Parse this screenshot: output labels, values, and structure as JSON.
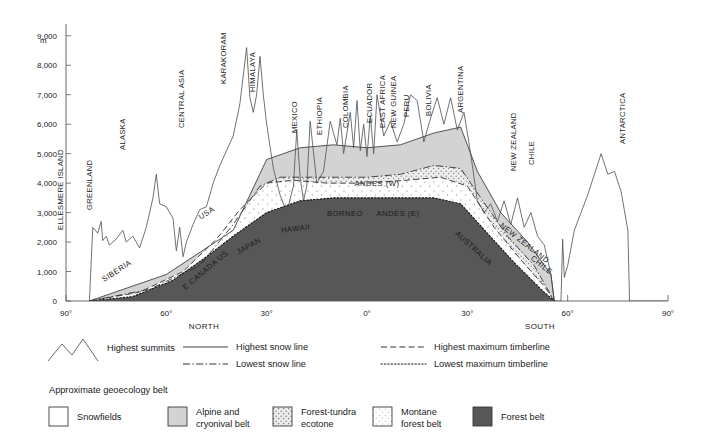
{
  "figure": {
    "unit_label": "m",
    "caption": ""
  },
  "chart_data": {
    "type": "area",
    "title": "",
    "xlabel": "",
    "ylabel": "m",
    "xlim": [
      -90,
      90
    ],
    "ylim": [
      0,
      9400
    ],
    "grid": false,
    "legend_position": "below-axis",
    "y_ticks": [
      "0",
      "1,000",
      "2,000",
      "3,000",
      "4,000",
      "5,000",
      "6,000",
      "7,000",
      "8,000",
      "9,000"
    ],
    "y_tick_values": [
      0,
      1000,
      2000,
      3000,
      4000,
      5000,
      6000,
      7000,
      8000,
      9000
    ],
    "x_ticks_north": [
      "90°",
      "60°",
      "30°",
      "0°"
    ],
    "x_ticks_south": [
      "30°",
      "60°",
      "90°"
    ],
    "x_tick_values": [
      -90,
      -60,
      -30,
      0,
      30,
      60,
      90
    ],
    "hemisphere_labels": {
      "left": "NORTH",
      "right": "SOUTH"
    },
    "series": [
      {
        "name": "Highest summits",
        "style": "solid-thin",
        "points": [
          [
            -83,
            0
          ],
          [
            -82,
            2500
          ],
          [
            -80.5,
            2300
          ],
          [
            -79.5,
            2700
          ],
          [
            -79,
            2050
          ],
          [
            -78,
            2200
          ],
          [
            -77,
            1900
          ],
          [
            -75,
            2100
          ],
          [
            -73,
            2400
          ],
          [
            -72,
            2000
          ],
          [
            -70,
            2200
          ],
          [
            -68,
            1800
          ],
          [
            -66,
            2500
          ],
          [
            -64,
            3500
          ],
          [
            -63,
            4300
          ],
          [
            -62,
            3300
          ],
          [
            -60,
            3200
          ],
          [
            -58,
            2800
          ],
          [
            -57,
            1700
          ],
          [
            -56,
            2500
          ],
          [
            -55,
            1500
          ],
          [
            -54,
            2000
          ],
          [
            -52,
            2600
          ],
          [
            -50,
            3100
          ],
          [
            -48,
            3200
          ],
          [
            -46,
            4000
          ],
          [
            -44,
            4600
          ],
          [
            -42,
            5100
          ],
          [
            -40,
            5600
          ],
          [
            -38,
            6700
          ],
          [
            -36,
            8600
          ],
          [
            -35,
            6900
          ],
          [
            -34,
            6400
          ],
          [
            -33,
            7000
          ],
          [
            -32,
            8300
          ],
          [
            -31,
            7000
          ],
          [
            -30,
            6000
          ],
          [
            -28,
            4500
          ],
          [
            -26,
            3600
          ],
          [
            -24,
            3000
          ],
          [
            -22,
            3900
          ],
          [
            -21,
            5800
          ],
          [
            -20,
            4200
          ],
          [
            -19,
            3400
          ],
          [
            -18,
            3900
          ],
          [
            -17,
            6100
          ],
          [
            -15,
            4000
          ],
          [
            -13,
            4400
          ],
          [
            -11,
            6100
          ],
          [
            -9,
            5300
          ],
          [
            -8,
            6200
          ],
          [
            -7,
            5000
          ],
          [
            -5,
            6400
          ],
          [
            -4,
            5200
          ],
          [
            -3,
            6800
          ],
          [
            -2,
            5100
          ],
          [
            -1,
            6000
          ],
          [
            0,
            4900
          ],
          [
            1,
            6300
          ],
          [
            2,
            5000
          ],
          [
            3,
            7000
          ],
          [
            5,
            5600
          ],
          [
            7,
            6100
          ],
          [
            9,
            5400
          ],
          [
            11,
            6000
          ],
          [
            13,
            7000
          ],
          [
            15,
            6800
          ],
          [
            17,
            5400
          ],
          [
            19,
            6200
          ],
          [
            21,
            6900
          ],
          [
            23,
            6000
          ],
          [
            25,
            6900
          ],
          [
            27,
            5800
          ],
          [
            29,
            6400
          ],
          [
            31,
            5000
          ],
          [
            33,
            3400
          ],
          [
            35,
            3000
          ],
          [
            37,
            3300
          ],
          [
            39,
            2700
          ],
          [
            41,
            3400
          ],
          [
            43,
            2600
          ],
          [
            45,
            3500
          ],
          [
            47,
            2500
          ],
          [
            49,
            3000
          ],
          [
            51,
            2200
          ],
          [
            53,
            1900
          ],
          [
            55,
            900
          ],
          [
            56,
            0
          ],
          [
            58,
            0
          ],
          [
            58.5,
            2100
          ],
          [
            59,
            800
          ],
          [
            60,
            1200
          ],
          [
            62,
            2400
          ],
          [
            66,
            3600
          ],
          [
            70,
            5000
          ],
          [
            72,
            4300
          ],
          [
            74,
            4400
          ],
          [
            76,
            3700
          ],
          [
            78,
            2400
          ],
          [
            78.5,
            0
          ],
          [
            90,
            0
          ]
        ]
      },
      {
        "name": "Highest snow line",
        "style": "solid",
        "points": [
          [
            -83,
            0
          ],
          [
            -60,
            900
          ],
          [
            -40,
            2400
          ],
          [
            -30,
            4800
          ],
          [
            -20,
            5200
          ],
          [
            -10,
            5300
          ],
          [
            0,
            5200
          ],
          [
            10,
            5300
          ],
          [
            20,
            5700
          ],
          [
            28,
            5900
          ],
          [
            33,
            4400
          ],
          [
            40,
            3000
          ],
          [
            48,
            2000
          ],
          [
            55,
            900
          ],
          [
            56,
            0
          ]
        ]
      },
      {
        "name": "Lowest snow line",
        "style": "dash-dot",
        "points": [
          [
            -83,
            0
          ],
          [
            -65,
            400
          ],
          [
            -50,
            1200
          ],
          [
            -40,
            2600
          ],
          [
            -32,
            3900
          ],
          [
            -26,
            4200
          ],
          [
            -18,
            4200
          ],
          [
            -10,
            4200
          ],
          [
            0,
            4200
          ],
          [
            10,
            4300
          ],
          [
            20,
            4600
          ],
          [
            28,
            4500
          ],
          [
            34,
            3500
          ],
          [
            42,
            2200
          ],
          [
            50,
            1200
          ],
          [
            56,
            0
          ]
        ]
      },
      {
        "name": "Highest maximum timberline",
        "style": "dashed",
        "points": [
          [
            -83,
            0
          ],
          [
            -68,
            300
          ],
          [
            -55,
            1000
          ],
          [
            -45,
            2100
          ],
          [
            -38,
            3100
          ],
          [
            -30,
            4000
          ],
          [
            -22,
            4100
          ],
          [
            -12,
            4000
          ],
          [
            0,
            4000
          ],
          [
            12,
            4100
          ],
          [
            22,
            4200
          ],
          [
            30,
            3900
          ],
          [
            38,
            2500
          ],
          [
            46,
            1400
          ],
          [
            53,
            500
          ],
          [
            56,
            0
          ]
        ]
      },
      {
        "name": "Lowest maximum timberline",
        "style": "dotted",
        "points": [
          [
            -83,
            0
          ],
          [
            -70,
            150
          ],
          [
            -58,
            700
          ],
          [
            -48,
            1500
          ],
          [
            -40,
            2200
          ],
          [
            -30,
            3000
          ],
          [
            -20,
            3400
          ],
          [
            -10,
            3500
          ],
          [
            0,
            3500
          ],
          [
            10,
            3500
          ],
          [
            20,
            3500
          ],
          [
            28,
            3300
          ],
          [
            36,
            2300
          ],
          [
            44,
            1300
          ],
          [
            52,
            400
          ],
          [
            56,
            0
          ]
        ]
      }
    ],
    "bands": [
      {
        "name": "Snowfields",
        "fill": "#ffffff",
        "above": "Highest snow line"
      },
      {
        "name": "Alpine and cryonival belt",
        "fill": "#d3d3d3",
        "between": [
          "Highest snow line",
          "Lowest snow line"
        ]
      },
      {
        "name": "Forest-tundra ecotone",
        "fill": "#e8e8e8",
        "between": [
          "Lowest snow line",
          "Highest maximum timberline"
        ]
      },
      {
        "name": "Montane forest belt",
        "fill": "#fbfbfb",
        "between": [
          "Highest maximum timberline",
          "Lowest maximum timberline"
        ]
      },
      {
        "name": "Forest belt",
        "fill": "#575757",
        "below": "Lowest maximum timberline"
      }
    ],
    "region_labels_above": [
      {
        "text": "ELLESMERE ISLAND",
        "x": 63,
        "y": 230
      },
      {
        "text": "GREENLAND",
        "x": 92,
        "y": 210
      },
      {
        "text": "ALASKA",
        "x": 125,
        "y": 150
      },
      {
        "text": "CENTRAL ASIA",
        "x": 184,
        "y": 128
      },
      {
        "text": "KARAKORAM",
        "x": 226,
        "y": 84
      },
      {
        "text": "HIMALAYA",
        "x": 255,
        "y": 92
      },
      {
        "text": "MEXICO",
        "x": 297,
        "y": 133
      },
      {
        "text": "ETHIOPIA",
        "x": 322,
        "y": 135
      },
      {
        "text": "COLOMBIA",
        "x": 348,
        "y": 128
      },
      {
        "text": "ECUADOR",
        "x": 372,
        "y": 123
      },
      {
        "text": "EAST AFRICA",
        "x": 385,
        "y": 128
      },
      {
        "text": "NEW GUINEA",
        "x": 396,
        "y": 128
      },
      {
        "text": "PERU",
        "x": 409,
        "y": 117
      },
      {
        "text": "BOLIVIA",
        "x": 431,
        "y": 116
      },
      {
        "text": "ARGENTINA",
        "x": 463,
        "y": 113
      },
      {
        "text": "NEW ZEALAND",
        "x": 516,
        "y": 171
      },
      {
        "text": "CHILE",
        "x": 534,
        "y": 165
      },
      {
        "text": "ANTARCTICA",
        "x": 625,
        "y": 144
      }
    ],
    "region_labels_inside": [
      {
        "text": "SIBERIA",
        "x": 118,
        "y": 273,
        "rot": -33
      },
      {
        "text": "USA",
        "x": 208,
        "y": 215,
        "rot": -33
      },
      {
        "text": "E CANADA US",
        "x": 207,
        "y": 272,
        "rot": -40
      },
      {
        "text": "JAPAN",
        "x": 250,
        "y": 248,
        "rot": -30
      },
      {
        "text": "HAWAII",
        "x": 296,
        "y": 231,
        "rot": -7
      },
      {
        "text": "BORNEO",
        "x": 345,
        "y": 216,
        "rot": 0
      },
      {
        "text": "ANDES (E)",
        "x": 398,
        "y": 216,
        "rot": 0
      },
      {
        "text": "ANDES (W)",
        "x": 377,
        "y": 186,
        "rot": 0
      },
      {
        "text": "AUSTRALIA",
        "x": 472,
        "y": 250,
        "rot": 42
      },
      {
        "text": "NEW ZEALAND",
        "x": 523,
        "y": 245,
        "rot": 38
      },
      {
        "text": "CHILE",
        "x": 540,
        "y": 267,
        "rot": 38
      }
    ]
  },
  "line_legend": {
    "summits_label": "Highest summits",
    "items": [
      {
        "label": "Highest snow line",
        "style": "solid"
      },
      {
        "label": "Lowest snow line",
        "style": "dash-dot"
      },
      {
        "label": "Highest maximum timberline",
        "style": "dashed"
      },
      {
        "label": "Lowest maximum timberline",
        "style": "dotted"
      }
    ]
  },
  "belt_legend": {
    "title": "Approximate geoecology belt",
    "items": [
      {
        "label": "Snowfields",
        "color": "#ffffff",
        "pattern": "none"
      },
      {
        "label": "Alpine and\ncryonival belt",
        "line1": "Alpine and",
        "line2": "cryonival belt",
        "color": "#d3d3d3",
        "pattern": "none"
      },
      {
        "label": "Forest-tundra\necotone",
        "line1": "Forest-tundra",
        "line2": "ecotone",
        "color": "#efefef",
        "pattern": "dots-dense"
      },
      {
        "label": "Montane\nforest belt",
        "line1": "Montane",
        "line2": "forest belt",
        "color": "#ffffff",
        "pattern": "dots-sparse"
      },
      {
        "label": "Forest belt",
        "color": "#575757",
        "pattern": "none"
      }
    ]
  },
  "colors": {
    "snowfields": "#ffffff",
    "alpine": "#d3d3d3",
    "ecotone": "#e8e8e8",
    "montane": "#fbfbfb",
    "forest": "#575757",
    "stroke": "#55595c"
  }
}
